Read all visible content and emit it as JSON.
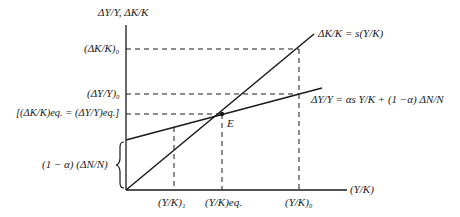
{
  "diagram": {
    "axes": {
      "y_label": "ΔY/Y, ΔK/K",
      "x_label": "(Y/K)"
    },
    "y_ticks": [
      {
        "id": "dk_k_0",
        "label": "(ΔK/K)₀"
      },
      {
        "id": "dy_y_0",
        "label": "(ΔY/Y)₀"
      },
      {
        "id": "equilibrium",
        "label": "[(ΔK/K)eq. = (ΔY/Y)eq.]"
      },
      {
        "id": "intercept",
        "label": "(1 − α) (ΔN/N)"
      }
    ],
    "x_ticks": [
      {
        "id": "yk_1",
        "label": "(Y/K)₁"
      },
      {
        "id": "yk_eq",
        "label": "(Y/K)eq."
      },
      {
        "id": "yk_0",
        "label": "(Y/K)₀"
      }
    ],
    "curves": [
      {
        "id": "capital_growth",
        "label": "ΔK/K = s(Y/K)"
      },
      {
        "id": "output_growth",
        "label": "ΔY/Y = αs Y/K + (1 −α) ΔN/N"
      }
    ],
    "points": [
      {
        "id": "equilibrium_point",
        "label": "E"
      }
    ],
    "colors": {
      "line": "#1a1a1a",
      "background": "#ffffff"
    }
  }
}
